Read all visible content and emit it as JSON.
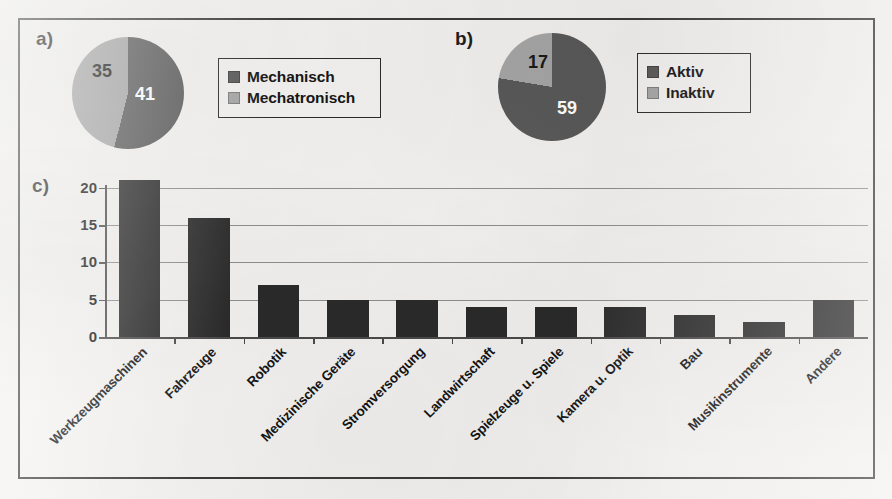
{
  "colors": {
    "dark_slice": "#595959",
    "light_slice": "#a6a6a6",
    "bar": "#2a2a2a",
    "gridline": "#8e8e8e",
    "frame": "#3b3b3b",
    "background": "#f2f1ef"
  },
  "panels": {
    "a": {
      "letter": "a)"
    },
    "b": {
      "letter": "b)"
    },
    "c": {
      "letter": "c)"
    }
  },
  "chart_data": [
    {
      "type": "pie",
      "panel": "a)",
      "title": "",
      "categories": [
        "Mechanisch",
        "Mechatronisch"
      ],
      "values": [
        41,
        35
      ],
      "labels": [
        "41",
        "35"
      ],
      "total": 76,
      "colors": [
        "#595959",
        "#a6a6a6"
      ],
      "legend": {
        "position": "right",
        "entries": [
          {
            "label": "Mechanisch",
            "color": "#595959"
          },
          {
            "label": "Mechatronisch",
            "color": "#a6a6a6"
          }
        ]
      }
    },
    {
      "type": "pie",
      "panel": "b)",
      "title": "",
      "categories": [
        "Aktiv",
        "Inaktiv"
      ],
      "values": [
        59,
        17
      ],
      "labels": [
        "59",
        "17"
      ],
      "total": 76,
      "colors": [
        "#595959",
        "#a6a6a6"
      ],
      "legend": {
        "position": "right",
        "entries": [
          {
            "label": "Aktiv",
            "color": "#595959"
          },
          {
            "label": "Inaktiv",
            "color": "#a6a6a6"
          }
        ]
      }
    },
    {
      "type": "bar",
      "panel": "c)",
      "title": "",
      "xlabel": "",
      "ylabel": "",
      "ylim": [
        0,
        22
      ],
      "yticks": [
        0,
        5,
        10,
        15,
        20
      ],
      "ytick_labels": [
        "0",
        "5",
        "10",
        "15",
        "20"
      ],
      "grid": true,
      "legend": null,
      "categories": [
        "Werkzeugmaschinen",
        "Fahrzeuge",
        "Robotik",
        "Medizinische Geräte",
        "Stromversorgung",
        "Landwirtschaft",
        "Spielzeuge u. Spiele",
        "Kamera u. Optik",
        "Bau",
        "Musikinstrumente",
        "Andere"
      ],
      "values": [
        21,
        16,
        7,
        5,
        5,
        4,
        4,
        4,
        3,
        2,
        5
      ],
      "bar_color": "#2a2a2a"
    }
  ]
}
